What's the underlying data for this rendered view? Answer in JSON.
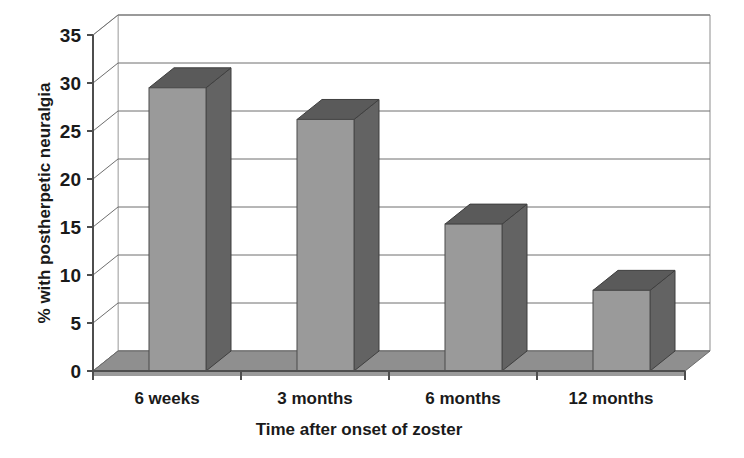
{
  "chart_data": {
    "type": "bar",
    "title": "",
    "subtitle": "",
    "xlabel": "Time after onset of zoster",
    "ylabel": "% with postherpetic neuralgia",
    "categories": [
      "6 weeks",
      "3 months",
      "6 months",
      "12 months"
    ],
    "values": [
      29.5,
      26.2,
      15.3,
      8.4
    ],
    "ylim": [
      0,
      35
    ],
    "ytick_step": 5,
    "ytick_labels": [
      "0",
      "5",
      "10",
      "15",
      "20",
      "25",
      "30",
      "35"
    ],
    "ytick_values": [
      0,
      5,
      10,
      15,
      20,
      25,
      30,
      35
    ],
    "grid": true,
    "grid_axis": "y",
    "legend": false,
    "legend_position": "none",
    "three_d": true,
    "annotations": [],
    "series": [
      {
        "name": "% with postherpetic neuralgia",
        "values": [
          29.5,
          26.2,
          15.3,
          8.4
        ]
      }
    ]
  },
  "colors": {
    "bar_front": "#9a9a9a",
    "bar_side": "#636363",
    "bar_top": "#5a5a5a",
    "floor_top": "#8f8f8f",
    "floor_side": "#9a9a9a",
    "wall_back": "#ffffff",
    "axis_line": "#4d4d4d",
    "grid_line": "#6e6e6e",
    "text": "#1a1a1a",
    "background": "#ffffff"
  }
}
